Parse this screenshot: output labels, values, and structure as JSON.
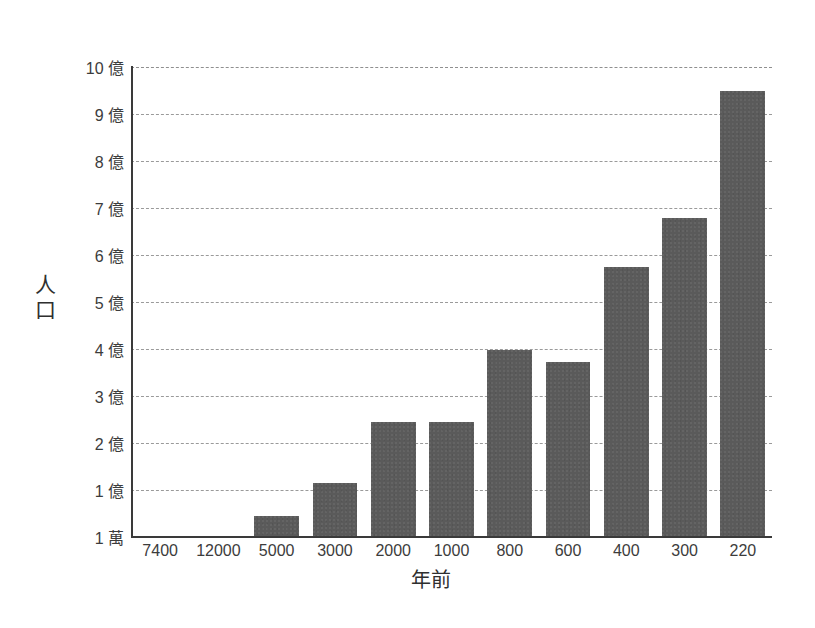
{
  "chart_data": {
    "type": "bar",
    "title": "",
    "subtitle": "",
    "xlabel": "年前",
    "ylabel": "人口",
    "categories": [
      "7400",
      "12000",
      "5000",
      "3000",
      "2000",
      "1000",
      "800",
      "600",
      "400",
      "300",
      "220"
    ],
    "values": [
      0.01,
      0.03,
      0.45,
      1.15,
      2.45,
      2.45,
      3.98,
      3.72,
      5.75,
      6.78,
      9.5
    ],
    "value_unit": "億",
    "ylim": [
      0,
      10
    ],
    "ytick_values": [
      10,
      9,
      8,
      7,
      6,
      5,
      4,
      3,
      2,
      1,
      0
    ],
    "ytick_labels": [
      "10 億",
      "9 億",
      "8 億",
      "7 億",
      "6 億",
      "5 億",
      "4 億",
      "3 億",
      "2 億",
      "1 億",
      "1 萬"
    ],
    "grid": true,
    "grid_style": "dashed-horizontal",
    "legend": false,
    "legend_position": "none",
    "bar_color": "#5a5a5a",
    "axis_color": "#3a3a3a",
    "grid_color": "#9a9a9a",
    "background_color": "#ffffff"
  }
}
